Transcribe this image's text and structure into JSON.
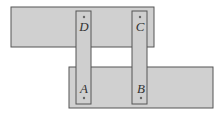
{
  "diagram": {
    "colors": {
      "fill": "#d0d0d0",
      "stroke": "#555555",
      "background": "#ffffff"
    },
    "top_plate": {
      "x": 11,
      "y": 7,
      "w": 143,
      "h": 40
    },
    "bottom_plate": {
      "x": 69,
      "y": 67,
      "w": 144,
      "h": 41
    },
    "strips": [
      {
        "x": 76,
        "y": 11,
        "w": 15,
        "h": 93
      },
      {
        "x": 132,
        "y": 11,
        "w": 15,
        "h": 93
      }
    ],
    "points": [
      {
        "label": "D",
        "dot_x": 84,
        "dot_y": 17,
        "label_x": 84,
        "label_y": 30
      },
      {
        "label": "C",
        "dot_x": 140,
        "dot_y": 17,
        "label_x": 140,
        "label_y": 30
      },
      {
        "label": "A",
        "dot_x": 84,
        "dot_y": 97,
        "label_x": 84,
        "label_y": 93
      },
      {
        "label": "B",
        "dot_x": 141,
        "dot_y": 97,
        "label_x": 141,
        "label_y": 93
      }
    ]
  }
}
